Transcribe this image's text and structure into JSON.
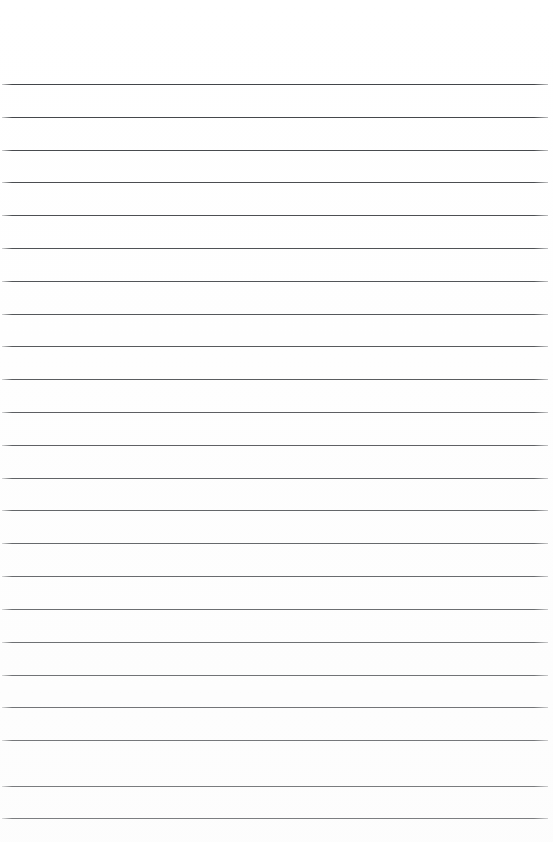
{
  "page": {
    "kind": "ruled-paper",
    "width_px": 553,
    "height_px": 842,
    "background_color": "#ffffff",
    "content_text": "",
    "has_text": false,
    "has_images": false,
    "orientation": "portrait"
  },
  "ruling": {
    "line_color": "#3c3f43",
    "line_thickness_px": 1,
    "line_count": 23,
    "first_line_y_px": 84,
    "line_spacing_px": 32.8,
    "line_start_x_px": 2,
    "line_end_x_px": 548,
    "line_length_px": 546,
    "style": "single-ruled-horizontal",
    "margin_rule": "none",
    "line_positions_y_px": [
      84,
      117,
      150,
      182,
      215,
      248,
      281,
      314,
      346,
      379,
      412,
      445,
      478,
      510,
      543,
      576,
      609,
      642,
      675,
      707,
      740,
      786,
      818
    ]
  },
  "margins": {
    "top_margin_px": 84,
    "bottom_margin_px": 24,
    "left_margin_px": 2,
    "right_margin_px": 5,
    "top_label": "top margin",
    "bottom_label": "bottom margin",
    "left_label": "left margin",
    "right_label": "right margin"
  },
  "writing_area": {
    "label": "writing area",
    "placeholder": ""
  }
}
